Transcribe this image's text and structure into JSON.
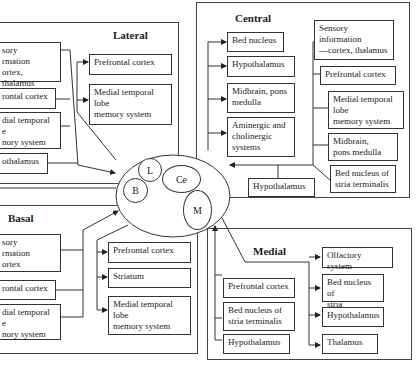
{
  "lateral": {
    "title": "Lateral",
    "inputs": [
      "sory\nrmation\nortex, thalamus",
      "rontal cortex",
      "dial temporal\ne\nnory system",
      "othalamus"
    ],
    "outputs": [
      "Prefrontal cortex",
      "Medial temporal\nlobe\nmemory system"
    ]
  },
  "central": {
    "title": "Central",
    "outputs": [
      "Bed nucleus",
      "Hypothalamus",
      "Midbrain, pons\nmedulla",
      "Aminergic and\ncholinergic\nsystems"
    ],
    "inputs": [
      "Sensory\ninformation\n—cortex, thalamus",
      "Prefrontal cortex",
      "Medial temporal\nlobe\nmemory system",
      "Midbrain,\npons medulla",
      "Bed nucleus of\nstria terminalis",
      "Hypothalamus"
    ]
  },
  "basal": {
    "title": "Basal",
    "inputs": [
      "sory\nrmation\nortex",
      "rontal cortex",
      "dial temporal\ne\nnory system"
    ],
    "outputs": [
      "Prefrontal cortex",
      "Striatum",
      "Medial temporal\nlobe\nmemory system"
    ]
  },
  "medial": {
    "title": "Medial",
    "inputs": [
      "Prefrontal cortex",
      "Bed nucleus of\nstria terminalis",
      "Hypothalamus"
    ],
    "outputs": [
      "Olfactory system",
      "Bed nucleus of\nstria terminalis",
      "Hypothalamus",
      "Thalamus"
    ]
  },
  "amygdala": {
    "nuclei": [
      "L",
      "B",
      "Ce",
      "M"
    ]
  }
}
